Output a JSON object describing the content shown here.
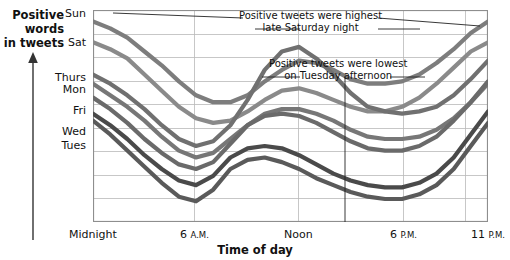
{
  "axis": {
    "y_title_lines": [
      "Positive",
      "words",
      "in tweets"
    ],
    "x_title": "Time of day",
    "x_ticks": [
      {
        "label": "Midnight",
        "small": "",
        "x": 93
      },
      {
        "label": "6",
        "small": "A.M.",
        "x": 194
      },
      {
        "label": "Noon",
        "small": "",
        "x": 298
      },
      {
        "label": "6",
        "small": "P.M.",
        "x": 403
      },
      {
        "label": "11",
        "small": "P.M.",
        "x": 488
      }
    ],
    "day_labels": [
      {
        "label": "Sun",
        "y": 8
      },
      {
        "label": "Sat",
        "y": 37
      },
      {
        "label": "Thurs",
        "y": 72
      },
      {
        "label": "Mon",
        "y": 84
      },
      {
        "label": "Fri",
        "y": 105
      },
      {
        "label": "Wed",
        "y": 126
      },
      {
        "label": "Tues",
        "y": 140
      }
    ]
  },
  "annotations": [
    {
      "id": "highest",
      "lines": [
        "Positive tweets were highest",
        "late Saturday night"
      ],
      "x": 310,
      "y": 10
    },
    {
      "id": "lowest",
      "lines": [
        "Positive tweets were lowest",
        "on Tuesday afternoon"
      ],
      "x": 338,
      "y": 58
    }
  ],
  "chart_data": {
    "type": "line",
    "title": "",
    "xlabel": "Time of day",
    "ylabel": "Positive words in tweets",
    "xlim": [
      "Midnight",
      "11 P.M."
    ],
    "xtick_labels": [
      "Midnight",
      "6 A.M.",
      "Noon",
      "6 P.M.",
      "11 P.M."
    ],
    "grid": true,
    "legend": "inline-left-axis-day-labels",
    "note_highest": "Positive tweets were highest late Saturday night",
    "note_lowest": "Positive tweets were lowest on Tuesday afternoon",
    "x": [
      0,
      1,
      2,
      3,
      4,
      5,
      6,
      7,
      8,
      9,
      10,
      11,
      12,
      13,
      14,
      15,
      16,
      17,
      18,
      19,
      20,
      21,
      22,
      23
    ],
    "series": [
      {
        "name": "Sun",
        "color": "#7d7d7d",
        "values": [
          97,
          94,
          90,
          84,
          78,
          71,
          65,
          62,
          62,
          65,
          71,
          76,
          80,
          79,
          76,
          72,
          70,
          70,
          71,
          74,
          79,
          85,
          92,
          97
        ]
      },
      {
        "name": "Sat",
        "color": "#8a8a8a",
        "values": [
          88,
          85,
          81,
          74,
          67,
          60,
          55,
          53,
          54,
          58,
          63,
          67,
          68,
          66,
          63,
          60,
          58,
          58,
          60,
          64,
          70,
          77,
          84,
          88
        ]
      },
      {
        "name": "Thurs",
        "color": "#707070",
        "values": [
          74,
          70,
          65,
          59,
          52,
          46,
          43,
          45,
          52,
          63,
          76,
          84,
          86,
          81,
          74,
          66,
          60,
          58,
          57,
          58,
          60,
          65,
          72,
          80
        ]
      },
      {
        "name": "Mon",
        "color": "#777777",
        "values": [
          70,
          65,
          60,
          54,
          47,
          41,
          38,
          40,
          46,
          52,
          57,
          59,
          59,
          57,
          54,
          50,
          47,
          46,
          46,
          47,
          50,
          55,
          62,
          70
        ]
      },
      {
        "name": "Fri",
        "color": "#6a6a6a",
        "values": [
          64,
          59,
          53,
          46,
          40,
          35,
          33,
          36,
          44,
          52,
          56,
          57,
          56,
          53,
          49,
          45,
          42,
          41,
          41,
          43,
          47,
          54,
          62,
          71
        ]
      },
      {
        "name": "Wed",
        "color": "#4a4a4a",
        "values": [
          57,
          52,
          46,
          39,
          33,
          28,
          26,
          30,
          38,
          42,
          43,
          42,
          39,
          35,
          31,
          28,
          26,
          25,
          25,
          27,
          31,
          38,
          48,
          58
        ]
      },
      {
        "name": "Tues",
        "color": "#5a5a5a",
        "values": [
          54,
          48,
          41,
          34,
          27,
          21,
          19,
          24,
          33,
          37,
          38,
          36,
          33,
          29,
          26,
          23,
          21,
          20,
          20,
          22,
          26,
          33,
          43,
          53
        ]
      }
    ]
  }
}
